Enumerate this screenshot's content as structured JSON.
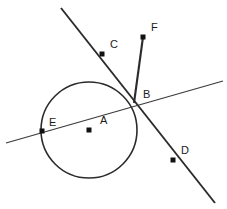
{
  "figure": {
    "type": "geometry-diagram",
    "width": 227,
    "height": 209,
    "background_color": "#ffffff",
    "stroke_color": "#2b2b2b",
    "label_color": "#1a1a1a"
  },
  "circle": {
    "name": "circle-A",
    "center_label": "A",
    "cx": 89,
    "cy": 130,
    "r": 48,
    "stroke_width": 1.6
  },
  "points": [
    {
      "id": "A",
      "label": "A",
      "x": 89,
      "y": 130,
      "label_x": 100,
      "label_y": 124,
      "marker": true,
      "role": "circle-center"
    },
    {
      "id": "B",
      "label": "B",
      "x": 134,
      "y": 102,
      "label_x": 143,
      "label_y": 98,
      "marker": false,
      "role": "intersection-on-circle"
    },
    {
      "id": "C",
      "label": "C",
      "x": 102,
      "y": 54,
      "label_x": 110,
      "label_y": 48,
      "marker": true,
      "role": "point-on-line-upper-left"
    },
    {
      "id": "D",
      "label": "D",
      "x": 173,
      "y": 160,
      "label_x": 181,
      "label_y": 154,
      "marker": true,
      "role": "point-on-line-lower-right"
    },
    {
      "id": "E",
      "label": "E",
      "x": 42,
      "y": 131,
      "label_x": 49,
      "label_y": 126,
      "marker": true,
      "role": "point-on-circle-secant"
    },
    {
      "id": "F",
      "label": "F",
      "x": 143,
      "y": 37,
      "label_x": 151,
      "label_y": 31,
      "marker": true,
      "role": "ray-endpoint"
    }
  ],
  "lines": [
    {
      "id": "line-CD",
      "name": "line-through-C-B-D",
      "through_labels": "C, B, D",
      "x1": 61,
      "y1": 8,
      "x2": 215,
      "y2": 203,
      "stroke_width": 1.9
    },
    {
      "id": "line-EB",
      "name": "secant-line-through-E-and-B",
      "through_labels": "E, B",
      "x1": 6,
      "y1": 143,
      "x2": 223,
      "y2": 81,
      "stroke_width": 1.3
    },
    {
      "id": "segment-FB",
      "name": "segment-F-to-B",
      "through_labels": "F, B",
      "x1": 143,
      "y1": 37,
      "x2": 134,
      "y2": 103,
      "stroke_width": 2.1
    }
  ]
}
